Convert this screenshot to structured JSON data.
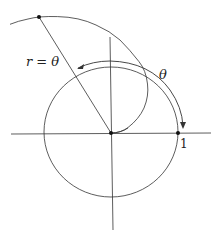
{
  "diagram": {
    "labels": {
      "spiral": "r = θ",
      "angle": "θ",
      "unit_tick": "1"
    },
    "colors": {
      "stroke": "#333333",
      "background": "#ffffff"
    }
  }
}
